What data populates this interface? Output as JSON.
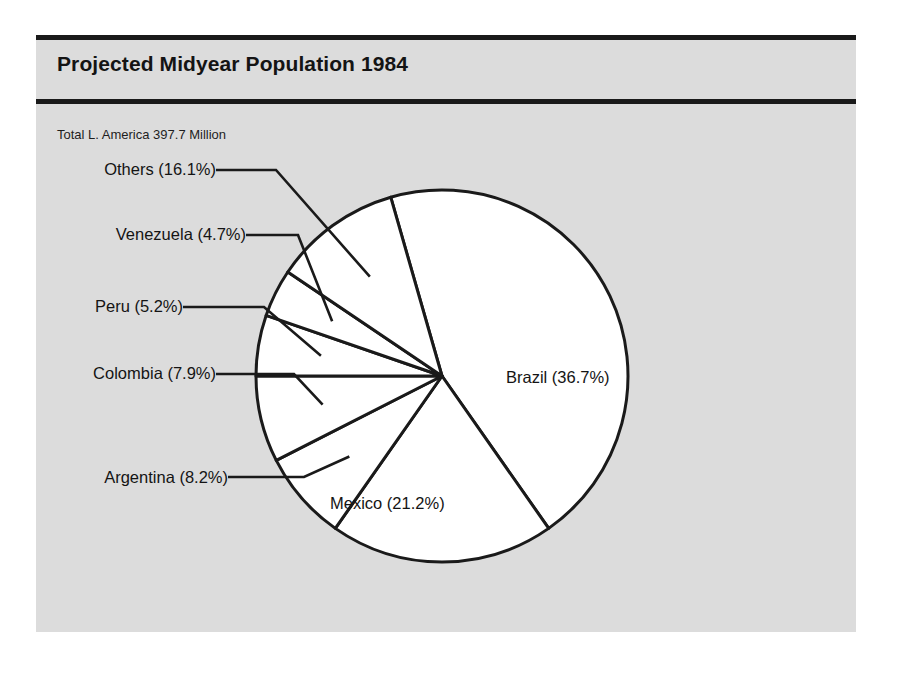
{
  "chart_data": {
    "type": "pie",
    "title": "Projected Midyear Population 1984",
    "subtitle": "Total L. America 397.7 Million",
    "total_value": 397.7,
    "total_units": "Million",
    "categories": [
      "Brazil",
      "Mexico",
      "Others",
      "Argentina",
      "Colombia",
      "Peru",
      "Venezuela"
    ],
    "values": [
      36.7,
      21.2,
      16.1,
      8.2,
      7.9,
      5.2,
      4.7
    ],
    "value_units": "percent",
    "legend_position": "none",
    "grid": false,
    "slices": [
      {
        "name": "Brazil",
        "label": "Brazil (36.7%)",
        "value": 36.7,
        "label_placement": "inside",
        "label_x": 470,
        "label_y": 348,
        "start_angle": -16,
        "end_angle": 145,
        "leader": false
      },
      {
        "name": "Mexico",
        "label": "Mexico (21.2%)",
        "value": 21.2,
        "label_placement": "inside",
        "label_x": 294,
        "label_y": 474,
        "start_angle": 145,
        "end_angle": 215,
        "leader": false
      },
      {
        "name": "Argentina",
        "label": "Argentina (8.2%)",
        "value": 8.2,
        "label_placement": "outside",
        "label_x": 192,
        "label_y": 448,
        "start_angle": 215,
        "end_angle": 243,
        "leader": true,
        "leader_y": 442,
        "leader_x_end": 268
      },
      {
        "name": "Colombia",
        "label": "Colombia (7.9%)",
        "value": 7.9,
        "label_placement": "outside",
        "label_x": 180,
        "label_y": 344,
        "start_angle": 243,
        "end_angle": 270,
        "leader": true,
        "leader_y": 339,
        "leader_x_end": 258
      },
      {
        "name": "Peru",
        "label": "Peru (5.2%)",
        "value": 5.2,
        "label_placement": "outside",
        "label_x": 147,
        "label_y": 277,
        "start_angle": 270,
        "end_angle": 289,
        "leader": true,
        "leader_y": 272,
        "leader_x_end": 228
      },
      {
        "name": "Venezuela",
        "label": "Venezuela (4.7%)",
        "value": 4.7,
        "label_placement": "outside",
        "label_x": 210,
        "label_y": 205,
        "start_angle": 289,
        "end_angle": 304,
        "leader": true,
        "leader_y": 200,
        "leader_x_end": 262
      },
      {
        "name": "Others",
        "label": "Others (16.1%)",
        "value": 16.1,
        "label_placement": "outside",
        "label_x": 180,
        "label_y": 140,
        "start_angle": 304,
        "end_angle": 344,
        "leader": true,
        "leader_y": 135,
        "leader_x_end": 240
      }
    ],
    "geometry": {
      "center_x": 406,
      "center_y": 341,
      "radius": 186
    },
    "colors": {
      "slice_fill": "#ffffff",
      "outline": "#1a1a1a",
      "panel_background": "#dcdcdc",
      "page_background": "#ffffff",
      "text": "#141414"
    }
  }
}
